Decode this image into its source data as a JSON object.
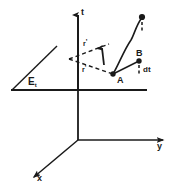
{
  "figure": {
    "type": "spacetime-diagram",
    "background_color": "#ffffff",
    "stroke_color": "#1a1a1a"
  },
  "axes": {
    "t_label": "t",
    "y_label": "y",
    "x_label": "x"
  },
  "plane": {
    "label_main": "E",
    "label_sub": "t"
  },
  "points": {
    "a_label": "A",
    "b_label": "B"
  },
  "vectors": {
    "r_upper": "r",
    "r_upper_prime": "'",
    "r_lower": "r",
    "r_lower_prime": "'"
  },
  "annotations": {
    "dt_label": "dt"
  }
}
